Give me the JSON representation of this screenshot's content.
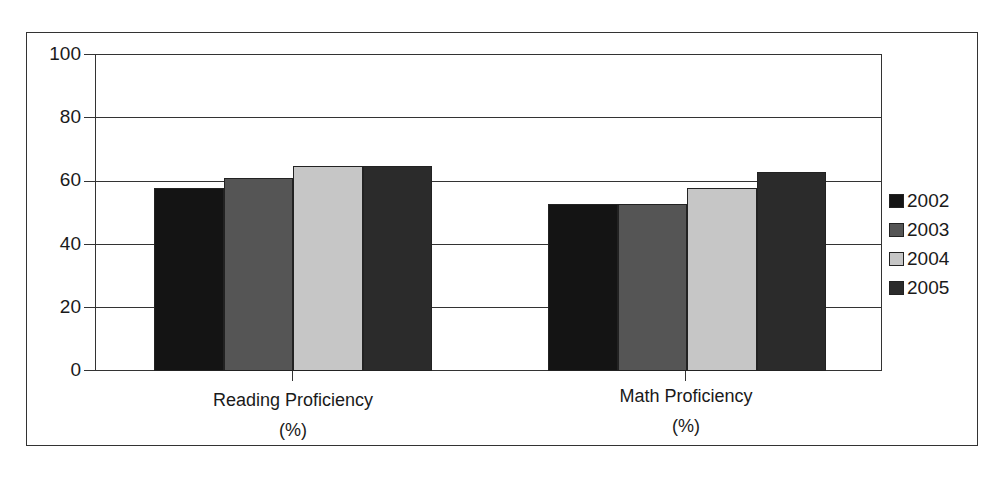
{
  "chart_data": {
    "type": "bar",
    "title": "",
    "xlabel": "",
    "ylabel": "",
    "categories": [
      "Reading Proficiency\n(%)",
      "Math Proficiency\n(%)"
    ],
    "category_lines": [
      [
        "Reading Proficiency",
        "(%)"
      ],
      [
        "Math Proficiency",
        "(%)"
      ]
    ],
    "series": [
      {
        "name": "2002",
        "color": "#141414",
        "values": [
          58,
          53
        ]
      },
      {
        "name": "2003",
        "color": "#555555",
        "values": [
          61,
          53
        ]
      },
      {
        "name": "2004",
        "color": "#c6c6c6",
        "values": [
          65,
          58
        ]
      },
      {
        "name": "2005",
        "color": "#2b2b2b",
        "values": [
          65,
          63
        ]
      }
    ],
    "ylim": [
      0,
      100
    ],
    "yticks": [
      0,
      20,
      40,
      60,
      80,
      100
    ],
    "grid": true,
    "legend_position": "right"
  },
  "legend": {
    "items": [
      {
        "label": "2002",
        "color": "#141414"
      },
      {
        "label": "2003",
        "color": "#555555"
      },
      {
        "label": "2004",
        "color": "#c6c6c6"
      },
      {
        "label": "2005",
        "color": "#2b2b2b"
      }
    ]
  },
  "axis": {
    "y_ticks": [
      "0",
      "20",
      "40",
      "60",
      "80",
      "100"
    ],
    "x_labels": [
      {
        "line1": "Reading Proficiency",
        "line2": "(%)"
      },
      {
        "line1": "Math Proficiency",
        "line2": "(%)"
      }
    ]
  }
}
